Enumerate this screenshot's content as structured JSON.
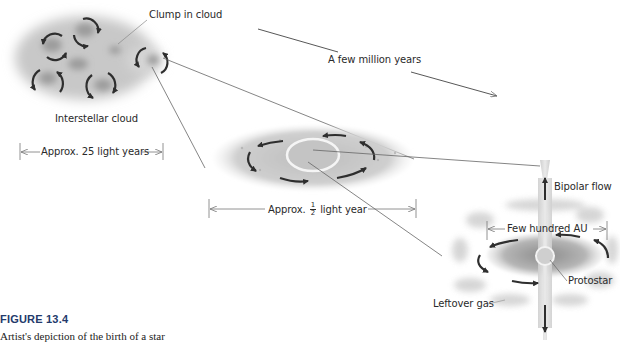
{
  "figure": {
    "number": "FIGURE 13.4",
    "caption": "Artist's depiction of the birth of a star"
  },
  "stages": {
    "cloud": {
      "label": "Interstellar cloud",
      "clump_label": "Clump in cloud",
      "scale_label": "Approx. 25 light years"
    },
    "time_label": "A few million years",
    "disk": {
      "scale_prefix": "Approx.",
      "scale_num": "1",
      "scale_den": "2",
      "scale_suffix": "light year"
    },
    "protostar": {
      "scale_label": "Few hundred AU",
      "bipolar_label": "Bipolar flow",
      "protostar_label": "Protostar",
      "leftover_label": "Leftover gas"
    }
  },
  "colors": {
    "figure_number": "#233a6b",
    "arrows": "#2e2e2e",
    "cloud_gray": "#9a9a9a",
    "lines": "#555555"
  }
}
